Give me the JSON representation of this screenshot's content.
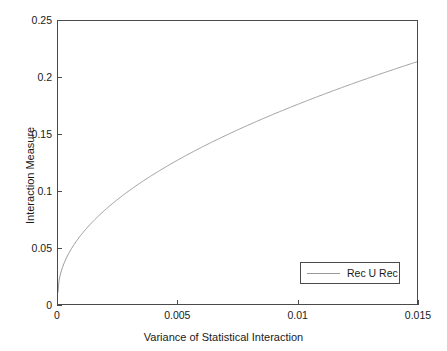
{
  "chart_data": {
    "type": "line",
    "title": "",
    "subtitle": "",
    "xlabel": "Variance of Statistical Interaction",
    "ylabel": "Interaction Measure",
    "xlim": [
      0,
      0.015
    ],
    "ylim": [
      0,
      0.25
    ],
    "xticks": [
      0,
      0.005,
      0.01,
      0.015
    ],
    "xtick_labels": [
      "0",
      "0.005",
      "0.01",
      "0.015"
    ],
    "yticks": [
      0,
      0.05,
      0.1,
      0.15,
      0.2,
      0.25
    ],
    "ytick_labels": [
      "0",
      "0.05",
      "0.1",
      "0.15",
      "0.2",
      "0.25"
    ],
    "grid": false,
    "legend_position": "lower right",
    "series": [
      {
        "name": "Rec U Rec",
        "color": "#9a9a9a",
        "x": [
          0.0,
          0.0001,
          0.00025,
          0.0005,
          0.00075,
          0.001,
          0.00125,
          0.0015,
          0.002,
          0.0025,
          0.003,
          0.0035,
          0.004,
          0.0045,
          0.005,
          0.0055,
          0.006,
          0.0065,
          0.007,
          0.0075,
          0.008,
          0.0085,
          0.009,
          0.0095,
          0.01,
          0.0105,
          0.011,
          0.0115,
          0.012,
          0.0125,
          0.013,
          0.0135,
          0.014,
          0.0145,
          0.015
        ],
        "y": [
          0.01,
          0.027,
          0.037,
          0.049,
          0.057,
          0.064,
          0.07,
          0.075,
          0.085,
          0.093,
          0.101,
          0.107,
          0.113,
          0.119,
          0.1325,
          0.128,
          0.133,
          0.138,
          0.142,
          0.147,
          0.151,
          0.168,
          0.159,
          0.163,
          0.172,
          0.176,
          0.18,
          0.184,
          0.188,
          0.192,
          0.196,
          0.2,
          0.205,
          0.209,
          0.214
        ]
      }
    ]
  },
  "legend": {
    "entries": [
      {
        "label": "Rec U Rec",
        "color": "#9a9a9a"
      }
    ]
  },
  "colors": {
    "curve": "#9a9a9a",
    "axis": "#4a4a4a",
    "background": "#ffffff",
    "text": "#1a1a1a"
  }
}
